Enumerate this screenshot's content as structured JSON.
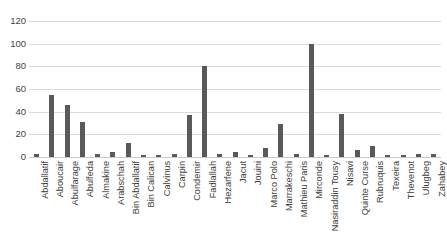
{
  "chart_data": {
    "type": "bar",
    "title": "",
    "xlabel": "",
    "ylabel": "",
    "ylim": [
      0,
      120
    ],
    "yticks": [
      0,
      20,
      40,
      60,
      80,
      100,
      120
    ],
    "grid": true,
    "legend": false,
    "bar_color": "#595959",
    "gridline_color": "#dadada",
    "axis_text_color": "#3f3f3f",
    "categories": [
      "Abdallatif",
      "Aboucair",
      "Abulfarage",
      "Abulfeda",
      "Almakine",
      "Arabschah",
      "Bin Abdallatif",
      "Bin Calican",
      "Calvinus",
      "Carpin",
      "Condemir",
      "Fadlallah",
      "Hezarfene",
      "Jacut",
      "Jouini",
      "Marco Polo",
      "Marrakeschi",
      "Mathieu Paris",
      "Mirconde",
      "Nasiraddin Tousy",
      "Nisavi",
      "Quinte Curse",
      "Rubruquis",
      "Texeira",
      "Thevenot",
      "Ulugbeg",
      "Zahabey"
    ],
    "values": [
      3,
      55,
      46,
      31,
      3,
      4,
      12,
      2,
      2,
      3,
      37,
      80,
      3,
      4,
      2,
      8,
      29,
      3,
      100,
      2,
      38,
      6,
      10,
      2,
      2,
      3,
      3
    ]
  }
}
